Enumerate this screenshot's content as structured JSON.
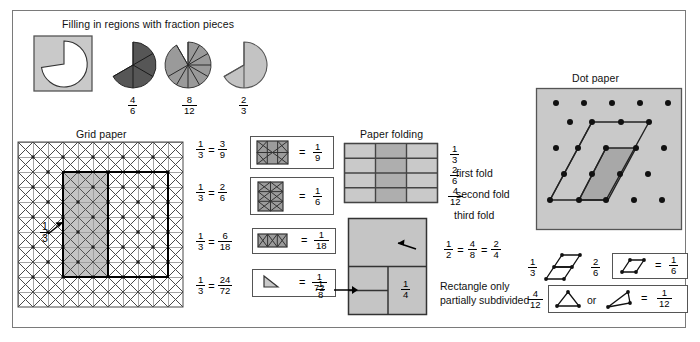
{
  "figure": {
    "sections": {
      "filling": {
        "title": "Filling in regions with fraction pieces",
        "pies": [
          {
            "name": "four-sixths",
            "numerator": "4",
            "denominator": "6"
          },
          {
            "name": "eight-twelfths",
            "numerator": "8",
            "denominator": "12"
          },
          {
            "name": "two-thirds",
            "numerator": "2",
            "denominator": "3"
          }
        ]
      },
      "grid_paper": {
        "title": "Grid paper",
        "region_label": {
          "numerator": "1",
          "denominator": "3"
        },
        "rows": [
          {
            "left_n": "1",
            "left_d": "3",
            "mid_n": "3",
            "mid_d": "9",
            "right_n": "1",
            "right_d": "9",
            "shape": "square-9"
          },
          {
            "left_n": "1",
            "left_d": "3",
            "mid_n": "2",
            "mid_d": "6",
            "right_n": "1",
            "right_d": "6",
            "shape": "rect-6"
          },
          {
            "left_n": "1",
            "left_d": "3",
            "mid_n": "6",
            "mid_d": "18",
            "right_n": "1",
            "right_d": "18",
            "shape": "rect-18"
          },
          {
            "left_n": "1",
            "left_d": "3",
            "mid_n": "24",
            "mid_d": "72",
            "right_n": "1",
            "right_d": "72",
            "shape": "triangle-72"
          }
        ],
        "equals": "=",
        "equals2": "="
      },
      "paper_folding": {
        "title": "Paper folding",
        "folds": [
          {
            "numerator": "1",
            "denominator": "3",
            "label": "first fold"
          },
          {
            "numerator": "2",
            "denominator": "6",
            "label": "second fold"
          },
          {
            "numerator": "4",
            "denominator": "12",
            "label": "third fold"
          }
        ],
        "rect_equation": {
          "a_n": "1",
          "a_d": "2",
          "b_n": "4",
          "b_d": "8",
          "c_n": "2",
          "c_d": "4",
          "eq1": "=",
          "eq2": "="
        },
        "eighth": {
          "numerator": "1",
          "denominator": "8"
        },
        "quarter": {
          "numerator": "1",
          "denominator": "4"
        },
        "caption_line1": "Rectangle only",
        "caption_line2": "partially subdivided"
      },
      "dot_paper": {
        "title": "Dot paper",
        "row1": {
          "left_n": "1",
          "left_d": "3",
          "mid_n": "2",
          "mid_d": "6",
          "equals": "=",
          "result_n": "1",
          "result_d": "6"
        },
        "row2": {
          "left_n": "4",
          "left_d": "12",
          "or_text": "or",
          "equals": "=",
          "result_n": "1",
          "result_d": "12"
        }
      }
    },
    "colors": {
      "light_gray": "#c9c9c9",
      "mid_gray": "#aaaaaa",
      "dark_gray": "#5a5a5a",
      "line": "#333333",
      "frame": "#7a7a7a"
    }
  }
}
